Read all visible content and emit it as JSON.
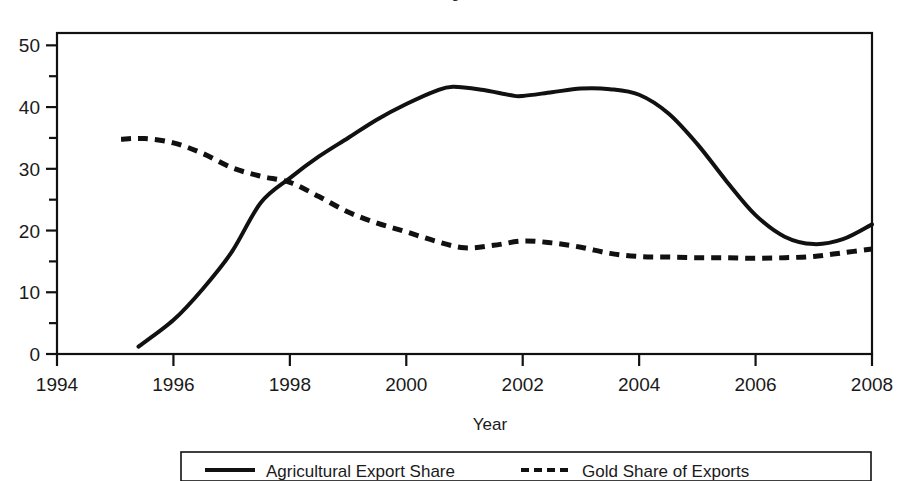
{
  "figure": {
    "clipped_title_fragment": "Figure",
    "background_color": "#ffffff",
    "ink_color": "#111111"
  },
  "axes": {
    "x_axis_title": "Year",
    "y_axis_title": "",
    "x_ticks": [
      "1994",
      "1996",
      "1998",
      "2000",
      "2002",
      "2004",
      "2006",
      "2008"
    ],
    "y_ticks": [
      "0",
      "10",
      "20",
      "30",
      "40",
      "50"
    ]
  },
  "legend": {
    "items": [
      {
        "label": "Agricultural Export Share",
        "style": "solid",
        "color": "#111111"
      },
      {
        "label": "Gold Share of Exports",
        "style": "dashed",
        "color": "#111111"
      }
    ]
  },
  "chart_data": {
    "type": "line",
    "title": "",
    "xlabel": "Year",
    "ylabel": "",
    "xlim": [
      1994,
      2008
    ],
    "ylim": [
      0,
      52
    ],
    "x_ticks": [
      1994,
      1996,
      1998,
      2000,
      2002,
      2004,
      2006,
      2008
    ],
    "y_ticks": [
      0,
      10,
      20,
      30,
      40,
      50
    ],
    "y_minor_ticks": [
      5,
      15,
      25,
      35,
      45
    ],
    "grid": false,
    "legend_position": "below-plot",
    "series": [
      {
        "name": "Agricultural Export Share",
        "style": "solid",
        "color": "#111111",
        "x": [
          1995.4,
          1996,
          1996.5,
          1997,
          1997.5,
          1998,
          1998.5,
          1999,
          1999.5,
          2000,
          2000.5,
          2000.8,
          2001.3,
          2001.8,
          2002.0,
          2002.5,
          2003.0,
          2003.5,
          2004.0,
          2004.5,
          2005.0,
          2005.5,
          2006.0,
          2006.5,
          2007.0,
          2007.5,
          2008.0
        ],
        "y": [
          1.2,
          5.5,
          10.5,
          16.5,
          24.5,
          28.5,
          32.0,
          35.0,
          38.0,
          40.5,
          42.6,
          43.3,
          42.8,
          41.9,
          41.8,
          42.4,
          43.0,
          42.9,
          42.0,
          39.0,
          34.0,
          28.0,
          22.5,
          19.0,
          17.8,
          18.6,
          21.0
        ]
      },
      {
        "name": "Gold Share of Exports",
        "style": "dashed",
        "color": "#111111",
        "x": [
          1995.1,
          1995.5,
          1996.0,
          1996.5,
          1997.0,
          1997.5,
          1998.0,
          1998.5,
          1999.0,
          1999.5,
          2000.0,
          2000.5,
          2001.0,
          2001.5,
          2002.0,
          2002.5,
          2003.0,
          2003.5,
          2004.0,
          2004.5,
          2005.0,
          2005.5,
          2006.0,
          2006.5,
          2007.0,
          2007.5,
          2008.0
        ],
        "y": [
          34.8,
          34.9,
          34.2,
          32.5,
          30.2,
          28.8,
          27.8,
          25.5,
          23.0,
          21.2,
          19.8,
          18.3,
          17.2,
          17.6,
          18.3,
          18.0,
          17.3,
          16.3,
          15.8,
          15.7,
          15.6,
          15.6,
          15.5,
          15.6,
          15.8,
          16.4,
          17.0
        ]
      }
    ]
  },
  "plot_geometry": {
    "left": 57,
    "right": 872,
    "top": 33,
    "bottom": 354
  }
}
